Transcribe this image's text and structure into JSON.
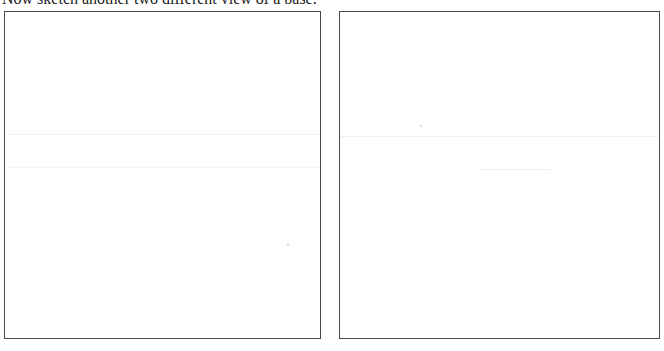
{
  "worksheet": {
    "instruction": "Now sketch another two different view of a base.",
    "drawing_boxes": [
      {
        "id": "view-1",
        "label": "",
        "content": ""
      },
      {
        "id": "view-2",
        "label": "",
        "content": ""
      }
    ],
    "border_color": "#4a4a4a",
    "background_color": "#ffffff"
  }
}
